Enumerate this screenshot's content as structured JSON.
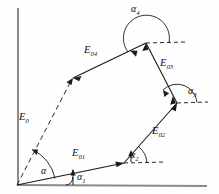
{
  "figure": {
    "background_color": "#fefefe",
    "axis_color": "#8a8a8a",
    "line_color": "#1a1a1a"
  },
  "axes": {
    "vertical_axis_name": "vertical-axis",
    "horizontal_axis_name": "horizontal-axis"
  },
  "vectors": [
    {
      "id": "E01",
      "symbol": "E",
      "subscript": "01",
      "label_x": 72,
      "label_y": 148,
      "style": "solid",
      "from": [
        17,
        185
      ],
      "to": [
        124,
        163
      ]
    },
    {
      "id": "E02",
      "symbol": "E",
      "subscript": "02",
      "label_x": 152,
      "label_y": 126,
      "style": "solid",
      "from": [
        124,
        163
      ],
      "to": [
        177,
        103
      ]
    },
    {
      "id": "E03",
      "symbol": "E",
      "subscript": "03",
      "label_x": 160,
      "label_y": 58,
      "style": "solid",
      "from": [
        146,
        43
      ],
      "to": [
        177,
        103
      ]
    },
    {
      "id": "E04",
      "symbol": "E",
      "subscript": "04",
      "label_x": 84,
      "label_y": 45,
      "style": "solid",
      "from": [
        146,
        43
      ],
      "to": [
        73,
        78
      ]
    },
    {
      "id": "E0",
      "symbol": "E",
      "subscript": "0",
      "label_x": 19,
      "label_y": 112,
      "style": "dashed",
      "from": [
        17,
        185
      ],
      "to": [
        73,
        78
      ]
    }
  ],
  "angles": [
    {
      "id": "alpha",
      "symbol": "α",
      "subscript": "",
      "label_x": 41,
      "label_y": 166,
      "vertex": [
        17,
        185
      ]
    },
    {
      "id": "alpha1",
      "symbol": "α",
      "subscript": "1",
      "label_x": 77,
      "label_y": 172,
      "vertex": [
        73,
        185
      ]
    },
    {
      "id": "alpha2",
      "symbol": "α",
      "subscript": "2",
      "label_x": 130,
      "label_y": 150,
      "vertex": [
        124,
        163
      ]
    },
    {
      "id": "alpha3",
      "symbol": "α",
      "subscript": "3",
      "label_x": 188,
      "label_y": 86,
      "vertex": [
        177,
        103
      ]
    },
    {
      "id": "alpha4",
      "symbol": "α",
      "subscript": "4",
      "label_x": 131,
      "label_y": 4,
      "vertex": [
        146,
        43
      ]
    }
  ]
}
